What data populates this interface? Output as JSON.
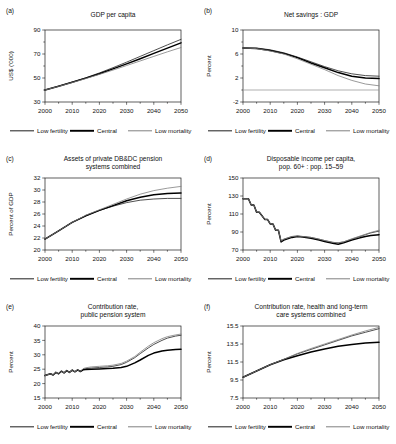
{
  "figure": {
    "legend": [
      {
        "key": "low_fertility",
        "label": "Low fertility",
        "color": "#303030"
      },
      {
        "key": "central",
        "label": "Central",
        "color": "#000000"
      },
      {
        "key": "low_mortality",
        "label": "Low mortality",
        "color": "#808080"
      }
    ],
    "x_tick_labels": [
      "2000",
      "2010",
      "2020",
      "2030",
      "2040",
      "2050"
    ]
  },
  "chart_data": [
    {
      "id": "a",
      "panel_label": "(a)",
      "type": "line",
      "title": "GDP per capita",
      "xlabel": "",
      "ylabel": "US$ ('000)",
      "xlim": [
        2000,
        2050
      ],
      "ylim": [
        30,
        90
      ],
      "yticks": [
        30,
        50,
        70,
        90
      ],
      "ytick_labels": [
        "30",
        "50",
        "70",
        "90"
      ],
      "y_minor_step": 10,
      "xticks": [
        2000,
        2010,
        2020,
        2030,
        2040,
        2050
      ],
      "x_minor_step": 5,
      "grid": false,
      "zero_line": null,
      "legend_position": "below",
      "x": [
        2000,
        2005,
        2010,
        2015,
        2020,
        2025,
        2030,
        2035,
        2040,
        2045,
        2050
      ],
      "series": [
        {
          "name": "Low fertility",
          "key": "low_fertility",
          "values": [
            40.0,
            43.2,
            46.6,
            50.2,
            54.2,
            58.6,
            63.2,
            68.0,
            72.8,
            77.6,
            82.2
          ]
        },
        {
          "name": "Central",
          "key": "central",
          "values": [
            40.0,
            43.1,
            46.4,
            49.9,
            53.6,
            57.6,
            61.8,
            66.1,
            70.5,
            74.9,
            79.3
          ]
        },
        {
          "name": "Low mortality",
          "key": "low_mortality",
          "values": [
            40.0,
            43.0,
            46.2,
            49.5,
            53.0,
            56.6,
            60.4,
            64.2,
            68.0,
            71.8,
            75.4
          ]
        }
      ]
    },
    {
      "id": "b",
      "panel_label": "(b)",
      "type": "line",
      "title": "Net savings : GDP",
      "xlabel": "",
      "ylabel": "Percent",
      "xlim": [
        2000,
        2050
      ],
      "ylim": [
        -2,
        10
      ],
      "yticks": [
        -2,
        2,
        6,
        10
      ],
      "ytick_labels": [
        "-2",
        "2",
        "6",
        "10"
      ],
      "y_minor_step": 2,
      "xticks": [
        2000,
        2010,
        2020,
        2030,
        2040,
        2050
      ],
      "x_minor_step": 5,
      "grid": false,
      "zero_line": 0,
      "legend_position": "below",
      "x": [
        2000,
        2005,
        2010,
        2015,
        2020,
        2025,
        2030,
        2035,
        2040,
        2045,
        2050
      ],
      "series": [
        {
          "name": "Low fertility",
          "key": "low_fertility",
          "values": [
            7.0,
            7.0,
            6.7,
            6.2,
            5.5,
            4.7,
            3.9,
            3.2,
            2.7,
            2.4,
            2.3
          ]
        },
        {
          "name": "Central",
          "key": "central",
          "values": [
            7.0,
            6.9,
            6.6,
            6.1,
            5.4,
            4.5,
            3.7,
            2.9,
            2.3,
            2.0,
            1.9
          ]
        },
        {
          "name": "Low mortality",
          "key": "low_mortality",
          "values": [
            7.0,
            6.9,
            6.5,
            6.0,
            5.2,
            4.3,
            3.4,
            2.4,
            1.6,
            1.0,
            0.7
          ]
        }
      ]
    },
    {
      "id": "c",
      "panel_label": "(c)",
      "type": "line",
      "title": "Assets of private DB&DC pension systems combined",
      "title_lines": [
        "Assets of private DB&DC pension",
        "systems combined"
      ],
      "xlabel": "",
      "ylabel": "Percent of GDP",
      "xlim": [
        2000,
        2050
      ],
      "ylim": [
        20,
        32
      ],
      "yticks": [
        20,
        22,
        24,
        26,
        28,
        30,
        32
      ],
      "ytick_labels": [
        "20",
        "22",
        "24",
        "26",
        "28",
        "30",
        "32"
      ],
      "y_minor_step": 2,
      "xticks": [
        2000,
        2010,
        2020,
        2030,
        2040,
        2050
      ],
      "x_minor_step": 5,
      "grid": false,
      "zero_line": null,
      "legend_position": "below",
      "x": [
        2000,
        2005,
        2010,
        2015,
        2020,
        2025,
        2030,
        2035,
        2040,
        2045,
        2050
      ],
      "series": [
        {
          "name": "Low fertility",
          "key": "low_fertility",
          "values": [
            21.8,
            23.2,
            24.6,
            25.7,
            26.6,
            27.3,
            27.9,
            28.3,
            28.5,
            28.6,
            28.6
          ]
        },
        {
          "name": "Central",
          "key": "central",
          "values": [
            21.8,
            23.2,
            24.6,
            25.7,
            26.6,
            27.4,
            28.2,
            28.8,
            29.2,
            29.4,
            29.5
          ]
        },
        {
          "name": "Low mortality",
          "key": "low_mortality",
          "values": [
            21.8,
            23.2,
            24.6,
            25.8,
            26.7,
            27.6,
            28.5,
            29.3,
            29.9,
            30.3,
            30.6
          ]
        }
      ]
    },
    {
      "id": "d",
      "panel_label": "(d)",
      "type": "line",
      "title": "Disposable income per capita, pop. 60+ : pop. 15–59",
      "title_lines": [
        "Disposable income per capita,",
        "pop. 60+ : pop. 15–59"
      ],
      "xlabel": "",
      "ylabel": "Percent",
      "xlim": [
        2000,
        2050
      ],
      "ylim": [
        70,
        150
      ],
      "yticks": [
        70,
        90,
        110,
        130,
        150
      ],
      "ytick_labels": [
        "70",
        "90",
        "110",
        "130",
        "150"
      ],
      "y_minor_step": 20,
      "xticks": [
        2000,
        2010,
        2020,
        2030,
        2040,
        2050
      ],
      "x_minor_step": 5,
      "grid": false,
      "zero_line": null,
      "legend_position": "below",
      "x": [
        2000,
        2002,
        2003,
        2004,
        2005,
        2006,
        2008,
        2009,
        2010,
        2011,
        2012,
        2013,
        2014,
        2015,
        2018,
        2020,
        2022,
        2025,
        2028,
        2030,
        2033,
        2035,
        2037,
        2040,
        2043,
        2045,
        2047,
        2050
      ],
      "series": [
        {
          "name": "Low fertility",
          "key": "low_fertility",
          "values": [
            127,
            127,
            120,
            120,
            112,
            112,
            104,
            104,
            99,
            99,
            92,
            92,
            80,
            82,
            85,
            85.5,
            85,
            84,
            82,
            80.5,
            78.5,
            78,
            79,
            82,
            85,
            87,
            89,
            91
          ]
        },
        {
          "name": "Central",
          "key": "central",
          "values": [
            127,
            127,
            120,
            120,
            112,
            112,
            104,
            104,
            99,
            99,
            92,
            92,
            79,
            81,
            84,
            85,
            84.5,
            83,
            81,
            79.5,
            77.5,
            76.5,
            78,
            81,
            83.5,
            85,
            86,
            87
          ]
        },
        {
          "name": "Low mortality",
          "key": "low_mortality",
          "values": [
            127,
            127,
            120,
            120,
            112,
            112,
            104,
            104,
            99,
            99,
            92,
            92,
            80,
            82,
            85,
            85.5,
            85,
            84,
            82,
            80.5,
            78.5,
            78,
            79,
            82.5,
            85.5,
            87.5,
            89.5,
            92
          ]
        }
      ]
    },
    {
      "id": "e",
      "panel_label": "(e)",
      "type": "line",
      "title": "Contribution rate, public pension system",
      "title_lines": [
        "Contribution rate,",
        "public pension system"
      ],
      "xlabel": "",
      "ylabel": "Percent",
      "xlim": [
        2000,
        2050
      ],
      "ylim": [
        15,
        40
      ],
      "yticks": [
        15,
        20,
        25,
        30,
        35,
        40
      ],
      "ytick_labels": [
        "15",
        "20",
        "25",
        "30",
        "35",
        "40"
      ],
      "y_minor_step": 5,
      "xticks": [
        2000,
        2010,
        2020,
        2030,
        2040,
        2050
      ],
      "x_minor_step": 5,
      "grid": false,
      "zero_line": null,
      "legend_position": "below",
      "x": [
        2000,
        2002,
        2003,
        2004,
        2005,
        2006,
        2007,
        2008,
        2009,
        2010,
        2011,
        2012,
        2013,
        2014,
        2015,
        2017,
        2020,
        2023,
        2025,
        2028,
        2030,
        2033,
        2035,
        2038,
        2040,
        2043,
        2045,
        2048,
        2050
      ],
      "series": [
        {
          "name": "Low fertility",
          "key": "low_fertility",
          "values": [
            22.8,
            23.4,
            23.0,
            23.9,
            23.4,
            24.3,
            23.7,
            24.5,
            23.9,
            24.7,
            24.1,
            24.8,
            24.2,
            25.0,
            25.2,
            25.4,
            25.6,
            25.8,
            26.0,
            26.6,
            27.4,
            29.0,
            30.4,
            32.4,
            33.6,
            35.0,
            35.8,
            36.5,
            36.8
          ]
        },
        {
          "name": "Central",
          "key": "central",
          "values": [
            22.8,
            23.4,
            23.0,
            23.9,
            23.4,
            24.3,
            23.7,
            24.5,
            23.9,
            24.7,
            24.1,
            24.8,
            24.2,
            24.8,
            24.9,
            25.0,
            25.1,
            25.2,
            25.3,
            25.6,
            26.0,
            27.2,
            28.2,
            29.8,
            30.6,
            31.3,
            31.6,
            31.8,
            31.9
          ]
        },
        {
          "name": "Low mortality",
          "key": "low_mortality",
          "values": [
            22.8,
            23.4,
            23.0,
            23.9,
            23.4,
            24.3,
            23.7,
            24.5,
            23.9,
            24.7,
            24.1,
            24.8,
            24.2,
            25.2,
            25.5,
            25.8,
            26.0,
            26.2,
            26.4,
            27.0,
            27.8,
            29.4,
            30.9,
            33.0,
            34.2,
            35.6,
            36.3,
            36.9,
            37.2
          ]
        }
      ]
    },
    {
      "id": "f",
      "panel_label": "(f)",
      "type": "line",
      "title": "Contribution rate, health and long-term care systems combined",
      "title_lines": [
        "Contribution rate, health and long-term",
        "care systems combined"
      ],
      "xlabel": "",
      "ylabel": "Percent",
      "xlim": [
        2000,
        2050
      ],
      "ylim": [
        7.5,
        15.5
      ],
      "yticks": [
        7.5,
        9.5,
        11.5,
        13.5,
        15.5
      ],
      "ytick_labels": [
        "7.5",
        "9.5",
        "11.5",
        "13.5",
        "15.5"
      ],
      "y_minor_step": 2,
      "xticks": [
        2000,
        2010,
        2020,
        2030,
        2040,
        2050
      ],
      "x_minor_step": 5,
      "grid": false,
      "zero_line": null,
      "legend_position": "below",
      "x": [
        2000,
        2005,
        2010,
        2015,
        2020,
        2025,
        2030,
        2035,
        2040,
        2045,
        2050
      ],
      "series": [
        {
          "name": "Low fertility",
          "key": "low_fertility",
          "values": [
            9.8,
            10.5,
            11.2,
            11.8,
            12.4,
            12.9,
            13.4,
            13.9,
            14.4,
            14.8,
            15.2
          ]
        },
        {
          "name": "Central",
          "key": "central",
          "values": [
            9.8,
            10.5,
            11.2,
            11.75,
            12.2,
            12.6,
            12.95,
            13.25,
            13.45,
            13.6,
            13.7
          ]
        },
        {
          "name": "Low mortality",
          "key": "low_mortality",
          "values": [
            9.8,
            10.5,
            11.2,
            11.8,
            12.45,
            13.0,
            13.5,
            14.0,
            14.5,
            14.95,
            15.35
          ]
        }
      ]
    }
  ]
}
